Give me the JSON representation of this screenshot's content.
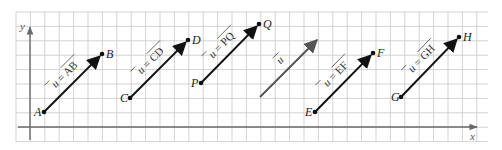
{
  "diagram": {
    "axes": {
      "x_label": "x",
      "y_label": "y"
    },
    "grid": {
      "left": 16,
      "top": 12,
      "right": 488,
      "bottom": 142,
      "cell": 14.4
    },
    "colors": {
      "vector": "#111111",
      "free_vector": "#555555",
      "grid": "#c8c8c8",
      "axis": "#6a6a6a"
    },
    "vectors": [
      {
        "id": "AB",
        "start_label": "A",
        "end_label": "B",
        "equation": "u⃗ = AB⃗",
        "eq_lhs": "u",
        "eq_rhs": "AB",
        "x1": 44,
        "y1": 112,
        "x2": 102,
        "y2": 54
      },
      {
        "id": "CD",
        "start_label": "C",
        "end_label": "D",
        "equation": "u⃗ = CD⃗",
        "eq_lhs": "u",
        "eq_rhs": "CD",
        "x1": 130,
        "y1": 98,
        "x2": 188,
        "y2": 40
      },
      {
        "id": "PQ",
        "start_label": "P",
        "end_label": "Q",
        "equation": "u⃗ = PQ⃗",
        "eq_lhs": "u",
        "eq_rhs": "PQ",
        "x1": 201,
        "y1": 83,
        "x2": 259,
        "y2": 24
      },
      {
        "id": "EF",
        "start_label": "E",
        "end_label": "F",
        "equation": "u⃗ = EF⃗",
        "eq_lhs": "u",
        "eq_rhs": "EF",
        "x1": 315,
        "y1": 112,
        "x2": 373,
        "y2": 53
      },
      {
        "id": "GH",
        "start_label": "G",
        "end_label": "H",
        "equation": "u⃗ = GH⃗",
        "eq_lhs": "u",
        "eq_rhs": "GH",
        "x1": 401,
        "y1": 97,
        "x2": 459,
        "y2": 37
      }
    ],
    "free_vector": {
      "label": "u",
      "x1": 260,
      "y1": 97,
      "x2": 317,
      "y2": 40
    }
  }
}
